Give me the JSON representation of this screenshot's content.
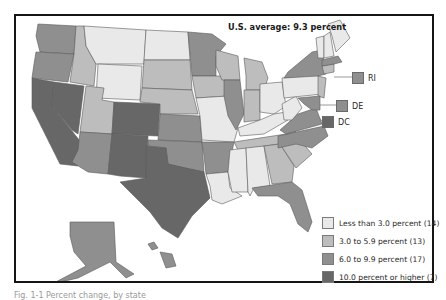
{
  "map": {
    "title": "U.S. average: 9.3 percent",
    "legend": [
      {
        "label": "Less than 3.0 percent (14)",
        "color": "#e9e9e9",
        "class": "c1"
      },
      {
        "label": "3.0 to 5.9 percent (13)",
        "color": "#bdbdbd",
        "class": "c2"
      },
      {
        "label": "6.0 to 9.9 percent (17)",
        "color": "#8f8f8f",
        "class": "c3"
      },
      {
        "label": "10.0 percent or higher (7)",
        "color": "#676767",
        "class": "c4"
      }
    ],
    "callouts": [
      {
        "label": "RI",
        "class": "c3"
      },
      {
        "label": "DE",
        "class": "c3"
      },
      {
        "label": "DC",
        "class": "c4"
      }
    ],
    "states": {
      "WA": "c3",
      "OR": "c3",
      "CA": "c4",
      "NV": "c4",
      "ID": "c2",
      "MT": "c1",
      "WY": "c1",
      "UT": "c2",
      "AZ": "c3",
      "CO": "c4",
      "NM": "c4",
      "ND": "c1",
      "SD": "c2",
      "NE": "c2",
      "KS": "c3",
      "OK": "c3",
      "TX": "c4",
      "MN": "c3",
      "IA": "c2",
      "MO": "c1",
      "AR": "c3",
      "LA": "c1",
      "WI": "c2",
      "IL": "c3",
      "MI": "c2",
      "IN": "c2",
      "OH": "c1",
      "KY": "c1",
      "TN": "c2",
      "MS": "c1",
      "AL": "c1",
      "GA": "c2",
      "FL": "c3",
      "SC": "c2",
      "NC": "c3",
      "VA": "c3",
      "WV": "c1",
      "PA": "c1",
      "NY": "c3",
      "NJ": "c2",
      "MD": "c3",
      "CT": "c2",
      "MA": "c3",
      "VT": "c1",
      "NH": "c1",
      "ME": "c1",
      "AK": "c3",
      "HI": "c3"
    }
  },
  "caption": "Fig. 1-1 Percent change, by state"
}
